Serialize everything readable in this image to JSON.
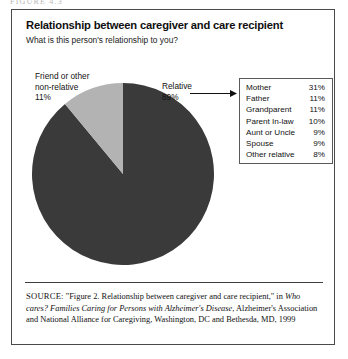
{
  "page": {
    "top_clip_text": "FIGURE 4.3"
  },
  "figure": {
    "title": "Relationship between caregiver and care recipient",
    "question": "What is this person's relationship to you?"
  },
  "callouts": {
    "left": {
      "line1": "Friend or other",
      "line2": "non-relative",
      "line3": "11%"
    },
    "right": {
      "line1": "Relative",
      "line2": "89%"
    },
    "arrow_icon": "arrow-right-icon"
  },
  "table": {
    "rows": [
      {
        "label": "Mother",
        "pct": "31%"
      },
      {
        "label": "Father",
        "pct": "11%"
      },
      {
        "label": "Grandparent",
        "pct": "11%"
      },
      {
        "label": "Parent In-law",
        "pct": "10%"
      },
      {
        "label": "Aunt or Uncle",
        "pct": "9%"
      },
      {
        "label": "Spouse",
        "pct": "9%"
      },
      {
        "label": "Other relative",
        "pct": "8%"
      }
    ]
  },
  "source": {
    "label": "SOURCE:",
    "text_part1": " \"Figure 2. Relationship between caregiver and care recipient,\" in ",
    "italic1": "Who cares? Families Caring for Persons with Alzheimer's Disease",
    "text_part2": ", Alzheimer's Association and National Alliance for Caregiving, Washington, DC and Bethesda, MD, 1999"
  },
  "colors": {
    "slice_relative": "#3a3a3a",
    "slice_nonrelative": "#b3b3b3",
    "frame": "#4a4a4a",
    "text": "#111111"
  },
  "chart_data": {
    "type": "pie",
    "title": "Relationship between caregiver and care recipient",
    "subtitle": "What is this person's relationship to you?",
    "categories": [
      "Relative",
      "Friend or other non-relative"
    ],
    "values": [
      89,
      11
    ],
    "unit": "%",
    "colors": [
      "#3a3a3a",
      "#b3b3b3"
    ],
    "start_angle_deg": 0,
    "direction": "counterclockwise",
    "legend": "none",
    "annotations": [
      {
        "text": "Relative 89%",
        "position": "right"
      },
      {
        "text": "Friend or other non-relative 11%",
        "position": "upper-left"
      }
    ],
    "breakdown_table": {
      "type": "table",
      "columns": [
        "Relationship",
        "Percent"
      ],
      "rows": [
        [
          "Mother",
          31
        ],
        [
          "Father",
          11
        ],
        [
          "Grandparent",
          11
        ],
        [
          "Parent In-law",
          10
        ],
        [
          "Aunt or Uncle",
          9
        ],
        [
          "Spouse",
          9
        ],
        [
          "Other relative",
          8
        ]
      ]
    }
  }
}
